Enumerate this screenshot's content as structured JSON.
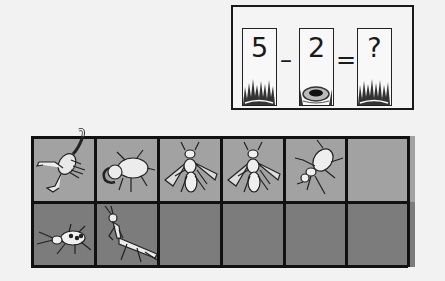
{
  "equation": {
    "cards": [
      {
        "value": "5",
        "scene": "grass"
      },
      {
        "value": "2",
        "scene": "hole"
      },
      {
        "value": "?",
        "scene": "grass"
      }
    ],
    "operators": [
      "–",
      "="
    ]
  },
  "grid": {
    "rows": 2,
    "columns": 6,
    "colors": {
      "top_row": "#a2a2a2",
      "bottom_row": "#7c7c7c",
      "lines": "#111111"
    },
    "cells": [
      [
        "scorpion-icon",
        "stag-beetle-icon",
        "fly-icon",
        "fly-icon",
        "beetle-icon",
        ""
      ],
      [
        "longhorn-beetle-icon",
        "mantis-icon",
        "",
        "",
        "",
        ""
      ]
    ]
  }
}
